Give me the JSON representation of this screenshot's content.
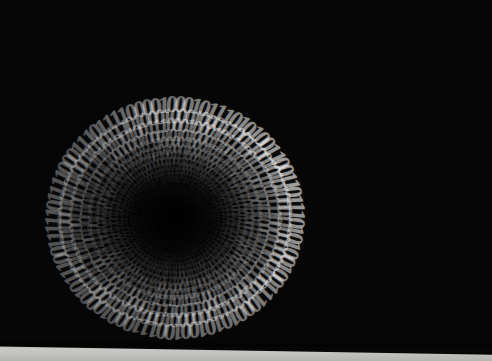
{
  "image": {
    "title": "Binary code vortex",
    "subject": "binary-digit-tunnel",
    "description": "Dense field of white serif 0 and 1 digits arranged on spiral rays converging into a dark circular vortex; digits grow larger toward the outer edges.",
    "alphabet": [
      "0",
      "1"
    ],
    "background_color": "#060606",
    "digit_color": "#ffffff",
    "floor_color": "#c9c9c6",
    "shadow_color": "#000000"
  },
  "geometry": {
    "width": 492,
    "height": 361,
    "vortex_center_x": 175,
    "vortex_center_y": 218,
    "ray_count": 92,
    "rings_per_ray": 26,
    "inner_radius": 6,
    "outer_radius": 560,
    "radius_growth": 1.118,
    "spiral_twist_deg": 30,
    "min_font_px": 1.4,
    "max_font_px": 46,
    "throat_radius": 62
  },
  "lighting": {
    "bright_angle_deg": -18,
    "bright_spread_deg": 130,
    "dim_opacity": 0.18,
    "bright_opacity": 1.0
  },
  "floor": {
    "label": "light-surface-band",
    "height_px": 22,
    "visible": true
  },
  "bit_stream": "01001101011001010111001101110011011000010110011101100101001000000110100101101110001000000110000100100000011000100110111101110100011101000110110001100101",
  "caption": {
    "alt_text": "Binary code vortex"
  }
}
